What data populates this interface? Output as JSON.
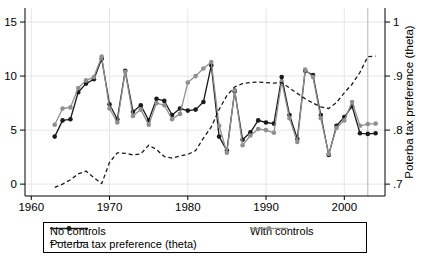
{
  "figure": {
    "background": "#ffffff",
    "grid_color": "#e6e6e6",
    "axis_color": "#000000",
    "reference_line_color": "#b5b5b5"
  },
  "legend": {
    "no_controls": "No controls",
    "with_controls": "With controls",
    "theta": "Poterba tax preference (theta)"
  },
  "chart_data": {
    "type": "line",
    "x": [
      1963,
      1964,
      1965,
      1966,
      1967,
      1968,
      1969,
      1970,
      1971,
      1972,
      1973,
      1974,
      1975,
      1976,
      1977,
      1978,
      1979,
      1980,
      1981,
      1982,
      1983,
      1984,
      1985,
      1986,
      1987,
      1988,
      1989,
      1990,
      1991,
      1992,
      1993,
      1994,
      1995,
      1996,
      1997,
      1998,
      1999,
      2000,
      2001,
      2002,
      2003,
      2004
    ],
    "series": [
      {
        "name": "No controls",
        "axis": "left",
        "color": "#1a1a1a",
        "style": "solid",
        "marker": "circle",
        "values": [
          4.4,
          5.9,
          6.0,
          8.5,
          9.3,
          9.7,
          11.6,
          7.4,
          6.0,
          10.5,
          6.7,
          7.3,
          5.9,
          7.9,
          7.7,
          6.4,
          7.0,
          6.8,
          6.9,
          7.6,
          11.0,
          4.4,
          3.1,
          8.6,
          4.1,
          4.8,
          5.9,
          5.7,
          5.6,
          9.9,
          6.4,
          4.2,
          10.5,
          10.1,
          6.4,
          2.7,
          5.4,
          6.2,
          7.2,
          4.7,
          4.65,
          4.7
        ]
      },
      {
        "name": "With controls",
        "axis": "left",
        "color": "#8f8f8f",
        "style": "solid",
        "marker": "circle",
        "values": [
          5.5,
          7.0,
          7.1,
          8.9,
          9.6,
          9.9,
          11.8,
          7.0,
          5.7,
          10.4,
          6.3,
          6.9,
          5.5,
          7.5,
          7.3,
          6.0,
          6.5,
          9.4,
          10.0,
          10.7,
          11.3,
          5.4,
          2.9,
          8.7,
          3.6,
          4.5,
          5.1,
          5.0,
          4.75,
          9.5,
          6.1,
          3.9,
          10.6,
          9.9,
          6.1,
          2.8,
          5.2,
          5.9,
          7.6,
          5.4,
          5.55,
          5.6
        ]
      },
      {
        "name": "Poterba tax preference (theta)",
        "axis": "right",
        "color": "#1a1a1a",
        "style": "dashed",
        "marker": "none",
        "values": [
          0.694,
          0.7,
          0.708,
          0.719,
          0.724,
          0.712,
          0.701,
          0.74,
          0.758,
          0.757,
          0.754,
          0.756,
          0.772,
          0.764,
          0.751,
          0.748,
          0.752,
          0.755,
          0.762,
          0.785,
          0.806,
          0.838,
          0.864,
          0.88,
          0.886,
          0.888,
          0.889,
          0.888,
          0.887,
          0.888,
          0.878,
          0.868,
          0.858,
          0.85,
          0.843,
          0.84,
          0.851,
          0.869,
          0.885,
          0.907,
          0.936,
          0.937
        ]
      }
    ],
    "x_axis": {
      "ticks": [
        1960,
        1970,
        1980,
        1990,
        2000
      ],
      "tick_labels": [
        "1960",
        "1970",
        "1980",
        "1990",
        "2000"
      ],
      "range": [
        1959.2,
        2005.2
      ]
    },
    "left_axis": {
      "ticks": [
        0,
        5,
        10,
        15
      ],
      "tick_labels": [
        "0",
        "5",
        "10",
        "15"
      ],
      "range": [
        -1.1,
        16.3
      ]
    },
    "right_axis": {
      "label": "Poterba tax preference (theta)",
      "ticks": [
        0.7,
        0.8,
        0.9,
        1.0
      ],
      "tick_labels": [
        ".7",
        ".8",
        ".9",
        "1"
      ],
      "range": [
        0.678,
        1.026
      ]
    },
    "vline_year": 2003,
    "grid": true,
    "legend_position": "bottom"
  }
}
